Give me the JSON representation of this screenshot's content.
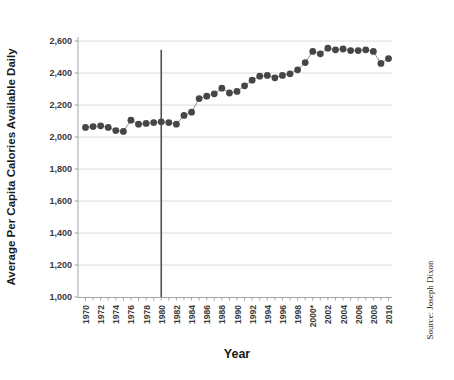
{
  "chart_data": {
    "type": "scatter",
    "title": "",
    "xlabel": "Year",
    "ylabel": "Average Per Capita Calories Available Daily",
    "source": "Source: Joseph Dixon",
    "xlim": [
      1969,
      2011.5
    ],
    "ylim": [
      1000,
      2600
    ],
    "grid": "horizontal",
    "legend": "none",
    "y_ticks": [
      1000,
      1200,
      1400,
      1600,
      1800,
      2000,
      2200,
      2400,
      2600
    ],
    "y_tick_labels": [
      "1,000",
      "1,200",
      "1,400",
      "1,600",
      "1,800",
      "2,000",
      "2,200",
      "2,400",
      "2,600"
    ],
    "x_tick_labels": [
      "1970",
      "1972",
      "1974",
      "1976",
      "1978",
      "1980",
      "1982",
      "1984",
      "1986",
      "1988",
      "1990",
      "1992",
      "1994",
      "1996",
      "1998",
      "2000*",
      "2002",
      "2004",
      "2006",
      "2008",
      "2010"
    ],
    "x": [
      1970,
      1971,
      1972,
      1973,
      1974,
      1975,
      1976,
      1977,
      1978,
      1979,
      1980,
      1981,
      1982,
      1983,
      1984,
      1985,
      1986,
      1987,
      1988,
      1989,
      1990,
      1991,
      1992,
      1993,
      1994,
      1995,
      1996,
      1997,
      1998,
      1999,
      2000,
      2001,
      2002,
      2003,
      2004,
      2005,
      2006,
      2007,
      2008,
      2009,
      2010
    ],
    "values": [
      2060,
      2065,
      2070,
      2060,
      2040,
      2035,
      2105,
      2080,
      2085,
      2090,
      2095,
      2090,
      2080,
      2135,
      2155,
      2240,
      2255,
      2270,
      2305,
      2275,
      2285,
      2320,
      2355,
      2380,
      2385,
      2370,
      2385,
      2395,
      2420,
      2465,
      2535,
      2520,
      2555,
      2545,
      2550,
      2540,
      2540,
      2545,
      2535,
      2460,
      2490
    ],
    "reference_line": {
      "x": 1980,
      "from_value": 1000,
      "to_value": 2545,
      "color": "#55504b"
    },
    "marker_color": "#464646",
    "line_color": "#8f8f8f",
    "grid_color": "#dcdcdc",
    "axis_color": "#a6a6a6",
    "text_color": "#3d3d3d"
  }
}
